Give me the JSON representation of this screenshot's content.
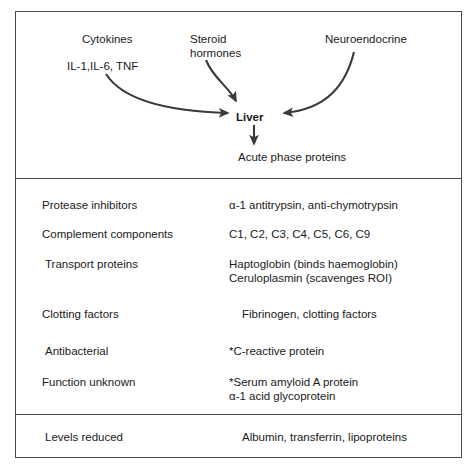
{
  "figure": {
    "border_color": "#4a4a4a"
  },
  "schematic": {
    "stimuli": [
      {
        "id": "cytokines",
        "label": "Cytokines"
      },
      {
        "id": "interleukins",
        "label": "IL-1,IL-6, TNF"
      },
      {
        "id": "steroid",
        "label": "Steroid\nhormones"
      },
      {
        "id": "neuroendocrine",
        "label": "Neuroendocrine"
      }
    ],
    "cytokines_label": "Cytokines",
    "interleukins_label": "IL-1,IL-6, TNF",
    "steroid_line1": "Steroid",
    "steroid_line2": "hormones",
    "neuroendocrine_label": "Neuroendocrine",
    "target_label": "Liver",
    "output_label": "Acute phase proteins",
    "arrows": [
      {
        "from": "cytokines",
        "to": "liver",
        "style": "curved"
      },
      {
        "from": "steroid",
        "to": "liver",
        "style": "curved"
      },
      {
        "from": "neuroendocrine",
        "to": "liver",
        "style": "curved"
      },
      {
        "from": "liver",
        "to": "acute-phase-proteins",
        "style": "straight"
      }
    ]
  },
  "protein_table": {
    "rows": [
      {
        "category": "Protease inhibitors",
        "values": [
          "α-1 antitrypsin, anti-chymotrypsin"
        ]
      },
      {
        "category": "Complement components",
        "values": [
          "C1, C2, C3, C4, C5, C6, C9"
        ]
      },
      {
        "category": "Transport proteins",
        "values": [
          "Haptoglobin (binds haemoglobin)",
          "Ceruloplasmin (scavenges ROI)"
        ]
      },
      {
        "category": "Clotting factors",
        "values": [
          "Fibrinogen, clotting factors"
        ]
      },
      {
        "category": "Antibacterial",
        "values": [
          "*C-reactive protein"
        ]
      },
      {
        "category": "Function unknown",
        "values": [
          "*Serum amyloid A protein",
          "α-1 acid glycoprotein"
        ]
      }
    ]
  },
  "reduced_table": {
    "rows": [
      {
        "category": "Levels reduced",
        "values": [
          "Albumin, transferrin, lipoproteins"
        ]
      }
    ]
  }
}
